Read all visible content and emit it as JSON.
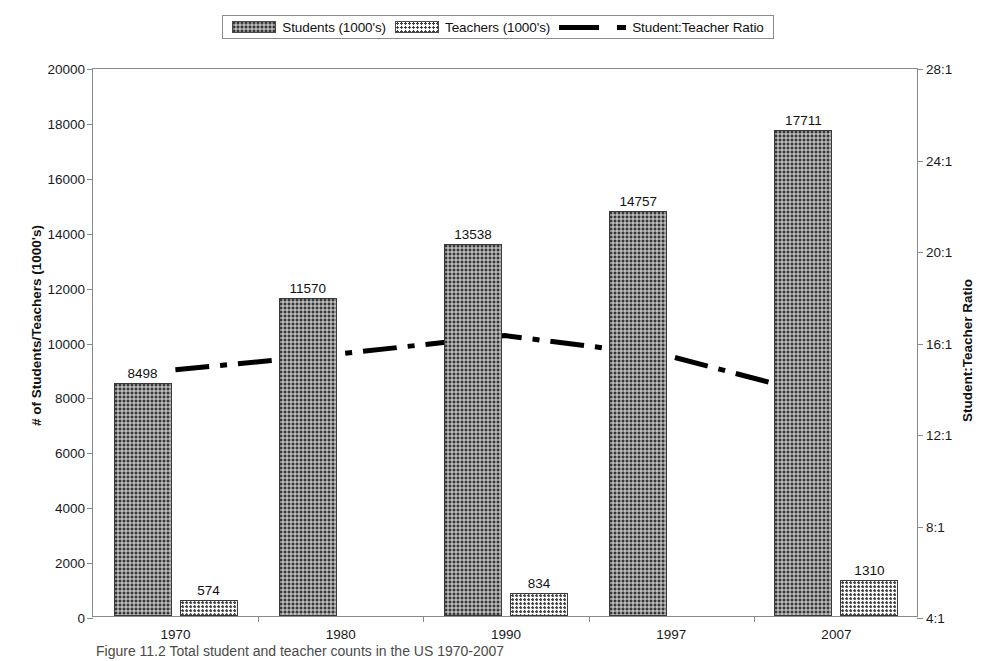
{
  "legend": {
    "items": [
      {
        "label": "Students (1000's)",
        "marker": "students-swatch"
      },
      {
        "label": "Teachers (1000's)",
        "marker": "teachers-swatch"
      },
      {
        "label": "Student:Teacher Ratio",
        "marker": "ratio-line-swatch"
      }
    ]
  },
  "axes": {
    "left_title": "# of Students/Teachers (1000's)",
    "right_title": "Student:Teacher Ratio",
    "left_ticks": [
      "20000",
      "18000",
      "16000",
      "14000",
      "12000",
      "10000",
      "8000",
      "6000",
      "4000",
      "2000",
      "0"
    ],
    "right_ticks": [
      "28:1",
      "24:1",
      "20:1",
      "16:1",
      "12:1",
      "8:1",
      "4:1"
    ]
  },
  "caption": "Figure 11.2   Total student and teacher counts in the US 1970-2007",
  "colors": {
    "bar_students": "#8d8d8d",
    "bar_teachers": "#fbfbfb",
    "ratio_line": "#000000",
    "axis": "#8a8a8a",
    "text": "#1a1a1a"
  },
  "chart_data": {
    "type": "bar",
    "title": "",
    "xlabel": "",
    "ylabel": "# of Students/Teachers (1000's)",
    "y2label": "Student:Teacher Ratio",
    "categories": [
      "1970",
      "1980",
      "1990",
      "1997",
      "2007"
    ],
    "ylim": [
      0,
      20000
    ],
    "ytick_step": 2000,
    "y2lim": [
      4,
      28
    ],
    "y2tick_step": 4,
    "grid": false,
    "legend_position": "top-center",
    "series": [
      {
        "name": "Students (1000's)",
        "type": "bar",
        "axis": "left",
        "values": [
          8498,
          11570,
          13538,
          14757,
          17711
        ],
        "labels": [
          "8498",
          "11570",
          "13538",
          "14757",
          "17711"
        ]
      },
      {
        "name": "Teachers (1000's)",
        "type": "bar",
        "axis": "left",
        "values": [
          574,
          null,
          834,
          null,
          1310
        ],
        "labels": [
          "574",
          "",
          "834",
          "",
          "1310"
        ]
      },
      {
        "name": "Student:Teacher Ratio",
        "type": "line",
        "axis": "right",
        "style": "dash-dot",
        "values": [
          14.8,
          15.5,
          16.3,
          15.4,
          13.5
        ],
        "labels": [
          "",
          "",
          "",
          "",
          ""
        ]
      }
    ]
  }
}
